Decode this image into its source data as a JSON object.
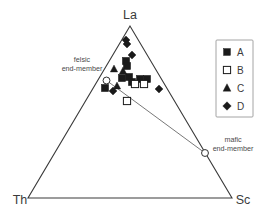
{
  "figure": {
    "type": "ternary-diagram",
    "apices": {
      "top": "La",
      "bottom_left": "Th",
      "bottom_right": "Sc"
    },
    "annotations": {
      "felsic_line1": "felsic",
      "felsic_line2": "end-member",
      "mafic_line1": "mafic",
      "mafic_line2": "end-member"
    },
    "legend": {
      "items": [
        {
          "label": "A",
          "marker": "filled-square-icon"
        },
        {
          "label": "B",
          "marker": "open-square-icon"
        },
        {
          "label": "C",
          "marker": "filled-triangle-icon"
        },
        {
          "label": "D",
          "marker": "filled-diamond-icon"
        }
      ]
    },
    "colors": {
      "line": "#3a3a3a",
      "marker_fill": "#1a1a1a",
      "marker_open_fill": "#ffffff",
      "tie_line": "#555555",
      "text": "#3b3b3b",
      "legend_border": "#9a9a9a",
      "background": "#ffffff"
    },
    "geometry": {
      "apex_top": [
        130,
        26
      ],
      "apex_left": [
        28,
        198
      ],
      "apex_right": [
        232,
        198
      ],
      "tie_line_start": [
        106.5,
        80.5
      ],
      "tie_line_end": [
        205,
        153
      ]
    }
  },
  "chart_data": {
    "type": "scatter",
    "title": "",
    "xlabel": "",
    "ylabel": "",
    "ternary_axes": [
      "La",
      "Th",
      "Sc"
    ],
    "legend_position": "right",
    "grid": false,
    "series": [
      {
        "name": "A",
        "marker": "filled-square",
        "points": [
          {
            "px": 126,
            "py": 61
          },
          {
            "px": 127,
            "py": 66
          },
          {
            "px": 105,
            "py": 88
          },
          {
            "px": 122,
            "py": 78
          },
          {
            "px": 129,
            "py": 77
          },
          {
            "px": 140,
            "py": 79
          },
          {
            "px": 147,
            "py": 79
          },
          {
            "px": 132,
            "py": 82
          }
        ]
      },
      {
        "name": "B",
        "marker": "open-square",
        "points": [
          {
            "px": 135,
            "py": 84
          },
          {
            "px": 144,
            "py": 84
          },
          {
            "px": 127,
            "py": 101
          }
        ]
      },
      {
        "name": "C",
        "marker": "filled-triangle",
        "points": [
          {
            "px": 114,
            "py": 69
          },
          {
            "px": 123,
            "py": 71
          },
          {
            "px": 117,
            "py": 86
          }
        ]
      },
      {
        "name": "D",
        "marker": "filled-diamond",
        "points": [
          {
            "px": 126,
            "py": 40
          },
          {
            "px": 127,
            "py": 44
          },
          {
            "px": 132,
            "py": 55
          },
          {
            "px": 159,
            "py": 89
          },
          {
            "px": 113,
            "py": 91
          }
        ]
      },
      {
        "name": "end-members",
        "marker": "open-circle",
        "points": [
          {
            "px": 106.5,
            "py": 80.5,
            "label": "felsic end-member"
          },
          {
            "px": 205,
            "py": 153,
            "label": "mafic end-member"
          }
        ]
      }
    ]
  }
}
